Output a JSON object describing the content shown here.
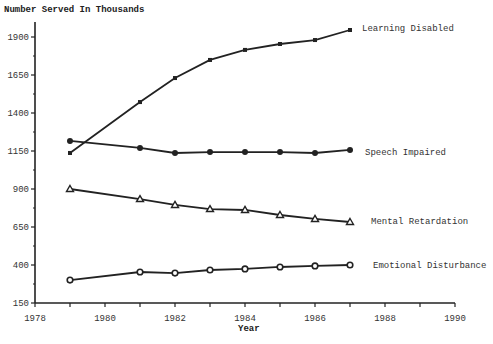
{
  "chart_data": {
    "type": "line",
    "title": "",
    "ylabel": "Number Served In Thousands",
    "xlabel": "Year",
    "xlim": [
      1978,
      1990
    ],
    "ylim": [
      150,
      1950
    ],
    "x_ticks": [
      1978,
      1980,
      1982,
      1984,
      1986,
      1988,
      1990
    ],
    "y_ticks": [
      150,
      400,
      650,
      900,
      1150,
      1400,
      1650,
      1900
    ],
    "grid": false,
    "legend_position": "inline-right",
    "x": [
      1979,
      1981,
      1982,
      1983,
      1984,
      1985,
      1986,
      1987
    ],
    "series": [
      {
        "name": "Learning Disabled",
        "marker": "square",
        "values": [
          1137,
          1472,
          1630,
          1749,
          1815,
          1854,
          1880,
          1946
        ]
      },
      {
        "name": "Speech Impaired",
        "marker": "circle-filled",
        "values": [
          1216,
          1170,
          1137,
          1143,
          1143,
          1143,
          1137,
          1157
        ]
      },
      {
        "name": "Mental Retardation",
        "marker": "triangle",
        "values": [
          900,
          834,
          795,
          768,
          762,
          729,
          703,
          683
        ]
      },
      {
        "name": "Emotional Disturbance",
        "marker": "circle-open",
        "values": [
          301,
          354,
          347,
          367,
          374,
          387,
          394,
          400
        ]
      }
    ]
  },
  "labels": {
    "ylabel": "Number Served In Thousands",
    "xlabel": "Year"
  }
}
